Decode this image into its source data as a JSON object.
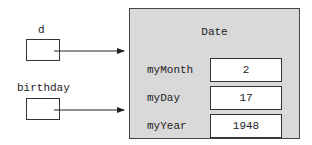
{
  "references": [
    {
      "name": "d"
    },
    {
      "name": "birthday"
    }
  ],
  "object": {
    "class_name": "Date",
    "fields": [
      {
        "name": "myMonth",
        "value": "2"
      },
      {
        "name": "myDay",
        "value": "17"
      },
      {
        "name": "myYear",
        "value": "1948"
      }
    ]
  },
  "colors": {
    "object_fill": "#d9d9d9",
    "stroke": "#333333"
  }
}
